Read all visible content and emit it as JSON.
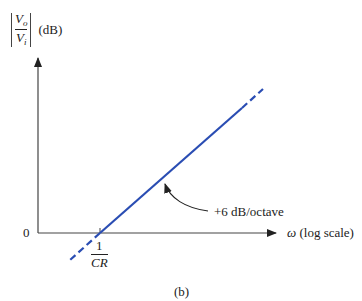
{
  "diagram": {
    "type": "bode-magnitude-asymptote",
    "panel_label": "(b)",
    "y_axis": {
      "label_numerator": "V",
      "label_numerator_sub": "o",
      "label_denominator": "V",
      "label_denominator_sub": "i",
      "unit": "(dB)"
    },
    "x_axis": {
      "symbol": "ω",
      "label": "(log scale)"
    },
    "origin_label": "0",
    "corner_frequency": {
      "numerator": "1",
      "denominator": "CR"
    },
    "slope_annotation": "+6 dB/octave",
    "colors": {
      "line": "#2a4db3",
      "axis": "#444444",
      "text": "#222222"
    }
  }
}
